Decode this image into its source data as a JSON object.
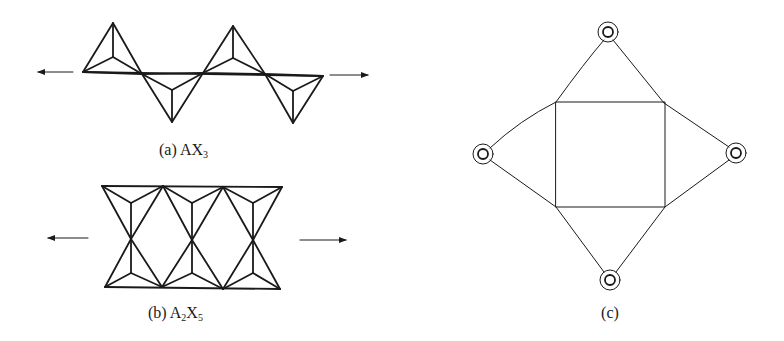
{
  "figure": {
    "panels": [
      {
        "id": "a",
        "label_prefix": "(a) ",
        "formula_main": "AX",
        "formula_sub": "3",
        "description": "Single chain of corner-sharing tetrahedra"
      },
      {
        "id": "b",
        "label_prefix": "(b) ",
        "formula_A": "A",
        "formula_A_sub": "2",
        "formula_X": "X",
        "formula_X_sub": "5",
        "description": "Double chain of tetrahedra"
      },
      {
        "id": "c",
        "label": "(c)",
        "description": "Square with four triangles and circled vertices"
      }
    ],
    "colors": {
      "line": "#1a1a1a",
      "background": "#ffffff"
    }
  }
}
